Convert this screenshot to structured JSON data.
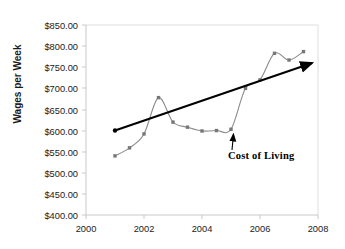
{
  "chart_data": {
    "type": "line",
    "title": "",
    "xlabel": "",
    "ylabel": "Wages per Week",
    "xlim": [
      2000,
      2008
    ],
    "ylim": [
      400,
      850
    ],
    "ytick_step": 50,
    "xtick_step": 2,
    "grid": false,
    "legend": "none",
    "y_tick_labels": [
      "$850.00",
      "$800.00",
      "$750.00",
      "$700.00",
      "$650.00",
      "$600.00",
      "$550.00",
      "$500.00",
      "$450.00",
      "$400.00"
    ],
    "y_tick_values": [
      850,
      800,
      750,
      700,
      650,
      600,
      550,
      500,
      450,
      400
    ],
    "x_tick_labels": [
      "2000",
      "2002",
      "2004",
      "2006",
      "2008"
    ],
    "x_tick_values": [
      2000,
      2002,
      2004,
      2006,
      2008
    ],
    "series": [
      {
        "name": "Cost of Living",
        "style": "smoothed-line-with-square-markers",
        "color": "#8c8c8c",
        "marker_color": "#777777",
        "x": [
          2001,
          2001.5,
          2002,
          2002.5,
          2003,
          2003.5,
          2004,
          2004.5,
          2005,
          2005.5,
          2006,
          2006.5,
          2007,
          2007.5
        ],
        "values": [
          540,
          559,
          592,
          678,
          620,
          608,
          599,
          600,
          603,
          700,
          720,
          783,
          767,
          787
        ]
      },
      {
        "name": "Trend line",
        "style": "straight-line-with-arrowhead",
        "color": "#000000",
        "x": [
          2001,
          2007.8
        ],
        "values": [
          600,
          760
        ]
      }
    ],
    "annotations": [
      {
        "text": "Cost of Living",
        "points_to_x": 2005,
        "points_to_y": 603,
        "arrow": true
      }
    ]
  },
  "axes": {
    "plot_border_color": "#d9d9d9",
    "tick_color": "#c8c8c8"
  }
}
